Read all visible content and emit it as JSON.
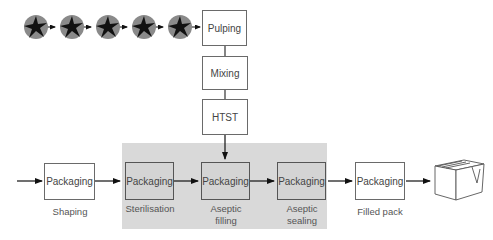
{
  "diagram": {
    "fruit_icons": [
      "fruit-icon",
      "fruit-icon",
      "fruit-icon",
      "fruit-icon",
      "fruit-icon"
    ],
    "top_chain": [
      {
        "label": "Pulping"
      },
      {
        "label": "Mixing"
      },
      {
        "label": "HTST"
      }
    ],
    "packaging_chain": [
      {
        "label": "Packaging",
        "caption": "Shaping",
        "shaded": false
      },
      {
        "label": "Packaging",
        "caption": "Sterilisation",
        "shaded": true
      },
      {
        "label": "Packaging",
        "caption": "Aseptic filling",
        "caption_lines": [
          "Aseptic",
          "filling"
        ],
        "shaded": true
      },
      {
        "label": "Packaging",
        "caption": "Aseptic sealing",
        "caption_lines": [
          "Aseptic",
          "sealing"
        ],
        "shaded": true
      },
      {
        "label": "Packaging",
        "caption": "Filled pack",
        "shaded": false
      }
    ],
    "aseptic_zone_color": "#d9d9d9",
    "end_icon": "carton-box-icon"
  }
}
